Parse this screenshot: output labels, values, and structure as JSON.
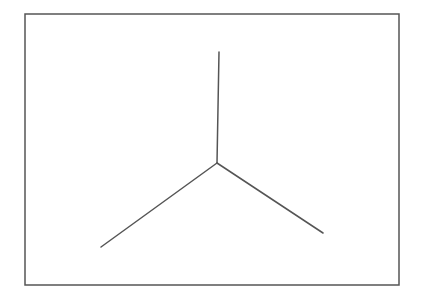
{
  "diagram": {
    "type": "line-drawing",
    "colors": {
      "background": "#ffffff",
      "stroke": "#555555"
    },
    "frame": {
      "x": 25,
      "y": 14,
      "width": 374,
      "height": 271,
      "stroke_width": 1.5
    },
    "junction": {
      "center": [
        217,
        163
      ],
      "arms": [
        {
          "name": "top",
          "end": [
            219,
            52
          ]
        },
        {
          "name": "bottom-left",
          "end": [
            101,
            247
          ]
        },
        {
          "name": "bottom-right",
          "end": [
            323,
            233
          ]
        }
      ],
      "stroke_width": 1.5
    }
  }
}
